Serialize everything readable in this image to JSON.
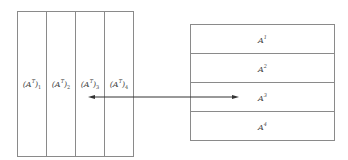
{
  "columns": [
    {
      "base": "(A",
      "sup": "T",
      "close": ")",
      "sub": "1"
    },
    {
      "base": "(A",
      "sup": "T",
      "close": ")",
      "sub": "2"
    },
    {
      "base": "(A",
      "sup": "T",
      "close": ")",
      "sub": "3"
    },
    {
      "base": "(A",
      "sup": "T",
      "close": ")",
      "sub": "4"
    }
  ],
  "rows": [
    {
      "base": "A",
      "sup": "1"
    },
    {
      "base": "A",
      "sup": "2"
    },
    {
      "base": "A",
      "sup": "3"
    },
    {
      "base": "A",
      "sup": "4"
    }
  ],
  "arrow": {
    "type": "double-headed",
    "from": "column 3",
    "to": "row 3"
  },
  "colors": {
    "line": "#8a8a8a",
    "arrow": "#333333"
  }
}
